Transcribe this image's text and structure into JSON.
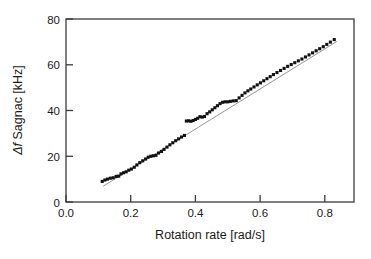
{
  "chart_data": {
    "type": "scatter",
    "title": "",
    "xlabel": "Rotation rate [rad/s]",
    "ylabel": "Δf Sagnac [kHz]",
    "ylabel_parts": {
      "symbol": "Δf",
      "rest": " Sagnac [kHz]"
    },
    "xlim": [
      0.0,
      0.89
    ],
    "ylim": [
      0,
      80
    ],
    "xticks": [
      0.0,
      0.2,
      0.4,
      0.6,
      0.8
    ],
    "xtick_labels": [
      "0.0",
      "0.2",
      "0.4",
      "0.6",
      "0.8"
    ],
    "yticks": [
      0,
      20,
      40,
      60,
      80
    ],
    "ytick_labels": [
      "0",
      "20",
      "40",
      "60",
      "80"
    ],
    "grid": false,
    "legend": null,
    "marker": "square",
    "marker_color": "#111111",
    "marker_size_px": 3.1,
    "frame_color": "#3b3b3b",
    "series": [
      {
        "name": "Measured Sagnac frequency shift",
        "type": "scatter",
        "x": [
          0.112,
          0.12,
          0.128,
          0.137,
          0.146,
          0.155,
          0.163,
          0.17,
          0.178,
          0.186,
          0.194,
          0.202,
          0.211,
          0.219,
          0.228,
          0.237,
          0.246,
          0.254,
          0.262,
          0.27,
          0.278,
          0.286,
          0.295,
          0.303,
          0.312,
          0.321,
          0.33,
          0.339,
          0.348,
          0.357,
          0.366,
          0.372,
          0.379,
          0.386,
          0.393,
          0.4,
          0.407,
          0.414,
          0.421,
          0.428,
          0.436,
          0.444,
          0.452,
          0.46,
          0.468,
          0.476,
          0.484,
          0.492,
          0.5,
          0.508,
          0.517,
          0.526,
          0.535,
          0.544,
          0.553,
          0.562,
          0.571,
          0.581,
          0.591,
          0.601,
          0.611,
          0.621,
          0.631,
          0.641,
          0.652,
          0.663,
          0.674,
          0.685,
          0.696,
          0.707,
          0.718,
          0.729,
          0.74,
          0.751,
          0.762,
          0.773,
          0.784,
          0.795,
          0.806,
          0.817,
          0.829
        ],
        "y": [
          9.0,
          9.6,
          10.0,
          10.4,
          10.6,
          11.2,
          11.3,
          12.3,
          12.8,
          13.2,
          13.9,
          14.4,
          15.2,
          16.2,
          17.2,
          18.0,
          18.8,
          19.6,
          20.0,
          20.2,
          20.4,
          21.4,
          22.1,
          23.0,
          24.0,
          25.0,
          25.9,
          26.8,
          27.6,
          28.4,
          29.1,
          35.4,
          35.5,
          35.3,
          35.6,
          36.1,
          36.6,
          37.3,
          37.1,
          37.4,
          38.6,
          39.4,
          40.3,
          41.2,
          42.1,
          43.0,
          43.6,
          43.8,
          43.8,
          44.0,
          44.2,
          44.3,
          45.5,
          46.6,
          47.7,
          48.6,
          49.4,
          50.3,
          51.2,
          52.1,
          53.0,
          53.9,
          54.8,
          55.7,
          56.6,
          57.5,
          58.4,
          59.3,
          60.1,
          60.9,
          61.7,
          62.5,
          63.4,
          64.3,
          65.2,
          66.1,
          67.0,
          67.9,
          68.9,
          69.9,
          71.0
        ]
      },
      {
        "name": "Linear fit",
        "type": "line",
        "color": "#8a8a8a",
        "x": [
          0.115,
          0.837
        ],
        "y": [
          6.9,
          70.2
        ]
      }
    ]
  }
}
